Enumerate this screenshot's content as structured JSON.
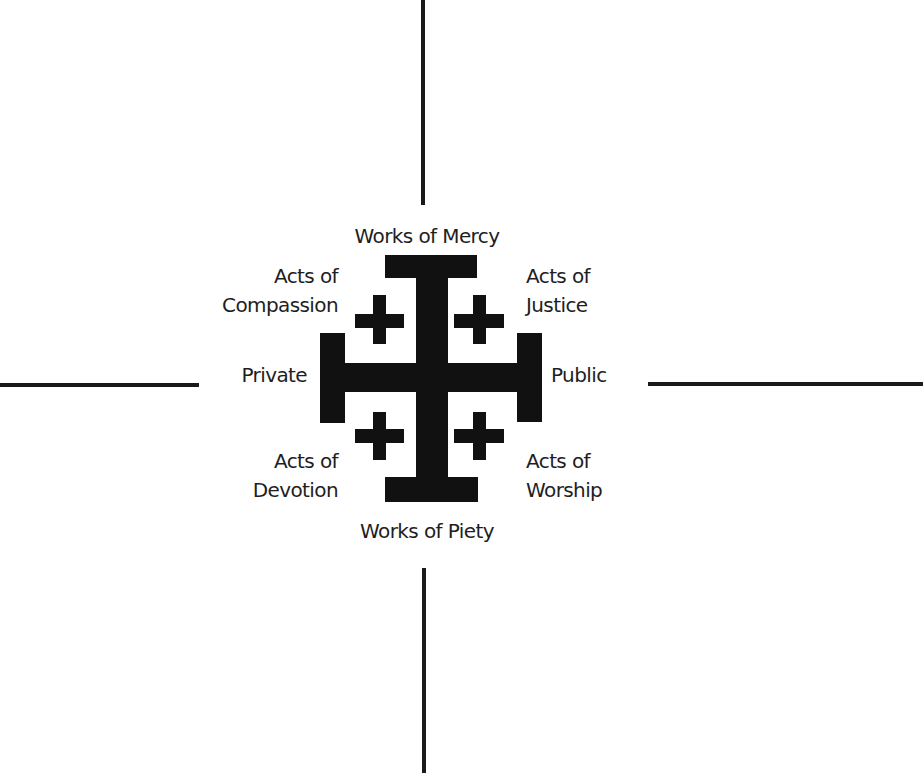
{
  "diagram": {
    "colors": {
      "background": "#ffffff",
      "cross": "#111111",
      "axis_lines": "#1a1a1a",
      "text": "#1e1e1e"
    },
    "central_symbol": "jerusalem-cross",
    "labels": {
      "top": "Works of Mercy",
      "bottom": "Works of Piety",
      "left": "Private",
      "right": "Public",
      "top_left": {
        "line1": "Acts of",
        "line2": "Compassion"
      },
      "top_right": {
        "line1": "Acts of",
        "line2": "Justice"
      },
      "bottom_left": {
        "line1": "Acts of",
        "line2": "Devotion"
      },
      "bottom_right": {
        "line1": "Acts of",
        "line2": "Worship"
      }
    },
    "axes": {
      "vertical": {
        "top_end": "Works of Mercy",
        "bottom_end": "Works of Piety"
      },
      "horizontal": {
        "left_end": "Private",
        "right_end": "Public"
      }
    }
  }
}
